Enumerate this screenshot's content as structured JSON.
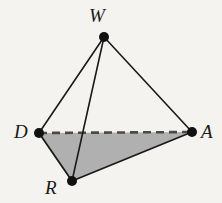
{
  "figure": {
    "kind": "geometry-diagram",
    "background_color": "#f4f3ef",
    "stroke_color": "#1a1a1a",
    "fill_color": "#b0b0b0",
    "vertices": [
      {
        "id": "W",
        "label": "W",
        "x": 104,
        "y": 37,
        "label_x": 89,
        "label_y": 6
      },
      {
        "id": "D",
        "label": "D",
        "x": 39,
        "y": 133,
        "label_x": 14,
        "label_y": 122
      },
      {
        "id": "A",
        "label": "A",
        "x": 192,
        "y": 132,
        "label_x": 201,
        "label_y": 122
      },
      {
        "id": "R",
        "label": "R",
        "x": 72,
        "y": 181,
        "label_x": 45,
        "label_y": 178
      }
    ],
    "edges": [
      {
        "id": "WD",
        "from": "W",
        "to": "D",
        "style": "solid",
        "width": 1.6
      },
      {
        "id": "WR",
        "from": "W",
        "to": "R",
        "style": "solid",
        "width": 1.6
      },
      {
        "id": "WA",
        "from": "W",
        "to": "A",
        "style": "solid",
        "width": 1.6
      },
      {
        "id": "DR",
        "from": "D",
        "to": "R",
        "style": "solid",
        "width": 1.8
      },
      {
        "id": "RA",
        "from": "R",
        "to": "A",
        "style": "solid",
        "width": 1.8
      },
      {
        "id": "DA",
        "from": "D",
        "to": "A",
        "style": "dashed",
        "width": 2.6
      }
    ],
    "shaded_face": {
      "id": "DRA",
      "points": "39,133 72,181 192,132"
    },
    "vertex_dot_radius": 5
  }
}
